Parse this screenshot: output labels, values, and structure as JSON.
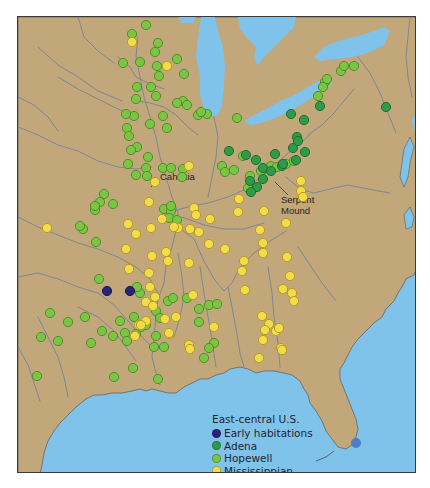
{
  "map": {
    "region": "East-central U.S.",
    "colors": {
      "land": "#c2a77b",
      "water": "#7fc3ea",
      "river": "#7c8894",
      "frame": "#3a3a3a",
      "early": "#2a2478",
      "adena": "#2f9a47",
      "hopewell": "#7cc443",
      "mississippian": "#f2dc4a"
    },
    "labels": {
      "cahokia": "Cahokia",
      "serpent_mound_line1": "Serpent",
      "serpent_mound_line2": "Mound"
    },
    "legend": {
      "title": "East-central U.S.",
      "items": [
        {
          "key": "early",
          "label": "Early habitations"
        },
        {
          "key": "adena",
          "label": "Adena"
        },
        {
          "key": "hopewell",
          "label": "Hopewell"
        },
        {
          "key": "mississippian",
          "label": "Mississippian"
        }
      ]
    },
    "sites": {
      "early": [
        [
          106,
          290
        ],
        [
          129,
          290
        ]
      ],
      "adena": [
        [
          385,
          106
        ],
        [
          290,
          113
        ],
        [
          303,
          119
        ],
        [
          245,
          154
        ],
        [
          255,
          159
        ],
        [
          262,
          167
        ],
        [
          228,
          150
        ],
        [
          249,
          180
        ],
        [
          270,
          170
        ],
        [
          274,
          153
        ],
        [
          292,
          147
        ],
        [
          296,
          136
        ],
        [
          297,
          140
        ],
        [
          256,
          186
        ],
        [
          262,
          178
        ],
        [
          281,
          165
        ],
        [
          250,
          191
        ],
        [
          282,
          163
        ],
        [
          319,
          105
        ],
        [
          304,
          151
        ],
        [
          295,
          159
        ]
      ],
      "hopewell": [
        [
          145,
          24
        ],
        [
          131,
          33
        ],
        [
          157,
          42
        ],
        [
          139,
          61
        ],
        [
          122,
          62
        ],
        [
          154,
          51
        ],
        [
          176,
          58
        ],
        [
          156,
          65
        ],
        [
          158,
          75
        ],
        [
          150,
          86
        ],
        [
          136,
          86
        ],
        [
          155,
          95
        ],
        [
          133,
          115
        ],
        [
          125,
          113
        ],
        [
          162,
          115
        ],
        [
          135,
          98
        ],
        [
          149,
          123
        ],
        [
          126,
          127
        ],
        [
          128,
          135
        ],
        [
          166,
          127
        ],
        [
          182,
          100
        ],
        [
          136,
          146
        ],
        [
          130,
          149
        ],
        [
          147,
          156
        ],
        [
          145,
          167
        ],
        [
          127,
          163
        ],
        [
          146,
          175
        ],
        [
          135,
          174
        ],
        [
          176,
          102
        ],
        [
          183,
          73
        ],
        [
          197,
          114
        ],
        [
          206,
          113
        ],
        [
          186,
          104
        ],
        [
          200,
          111
        ],
        [
          221,
          165
        ],
        [
          242,
          155
        ],
        [
          236,
          117
        ],
        [
          317,
          95
        ],
        [
          324,
          81
        ],
        [
          322,
          86
        ],
        [
          326,
          78
        ],
        [
          340,
          70
        ],
        [
          343,
          65
        ],
        [
          353,
          65
        ],
        [
          247,
          187
        ],
        [
          249,
          175
        ],
        [
          263,
          168
        ],
        [
          260,
          170
        ],
        [
          270,
          165
        ],
        [
          276,
          166
        ],
        [
          285,
          163
        ],
        [
          293,
          160
        ],
        [
          233,
          169
        ],
        [
          224,
          171
        ],
        [
          162,
          167
        ],
        [
          170,
          167
        ],
        [
          182,
          168
        ],
        [
          181,
          176
        ],
        [
          163,
          208
        ],
        [
          170,
          210
        ],
        [
          170,
          205
        ],
        [
          168,
          217
        ],
        [
          176,
          219
        ],
        [
          103,
          193
        ],
        [
          99,
          201
        ],
        [
          94,
          209
        ],
        [
          82,
          228
        ],
        [
          112,
          203
        ],
        [
          79,
          225
        ],
        [
          95,
          241
        ],
        [
          94,
          205
        ],
        [
          167,
          300
        ],
        [
          172,
          297
        ],
        [
          155,
          310
        ],
        [
          139,
          292
        ],
        [
          133,
          316
        ],
        [
          159,
          317
        ],
        [
          119,
          320
        ],
        [
          124,
          332
        ],
        [
          135,
          333
        ],
        [
          140,
          326
        ],
        [
          145,
          324
        ],
        [
          126,
          340
        ],
        [
          155,
          335
        ],
        [
          163,
          346
        ],
        [
          198,
          308
        ],
        [
          208,
          304
        ],
        [
          216,
          303
        ],
        [
          198,
          321
        ],
        [
          213,
          342
        ],
        [
          208,
          347
        ],
        [
          153,
          346
        ],
        [
          113,
          376
        ],
        [
          157,
          378
        ],
        [
          203,
          357
        ],
        [
          136,
          286
        ],
        [
          186,
          297
        ],
        [
          98,
          278
        ],
        [
          90,
          342
        ],
        [
          40,
          336
        ],
        [
          57,
          340
        ],
        [
          67,
          321
        ],
        [
          84,
          316
        ],
        [
          101,
          330
        ],
        [
          49,
          312
        ],
        [
          36,
          375
        ],
        [
          112,
          335
        ],
        [
          132,
          367
        ]
      ],
      "mississippian": [
        [
          131,
          41
        ],
        [
          166,
          65
        ],
        [
          154,
          181
        ],
        [
          188,
          165
        ],
        [
          193,
          207
        ],
        [
          195,
          214
        ],
        [
          148,
          201
        ],
        [
          161,
          218
        ],
        [
          177,
          227
        ],
        [
          165,
          251
        ],
        [
          151,
          255
        ],
        [
          167,
          260
        ],
        [
          148,
          272
        ],
        [
          149,
          286
        ],
        [
          154,
          296
        ],
        [
          145,
          301
        ],
        [
          152,
          305
        ],
        [
          145,
          320
        ],
        [
          168,
          333
        ],
        [
          168,
          332
        ],
        [
          175,
          316
        ],
        [
          164,
          318
        ],
        [
          188,
          344
        ],
        [
          189,
          348
        ],
        [
          138,
          324
        ],
        [
          134,
          335
        ],
        [
          140,
          324
        ],
        [
          127,
          223
        ],
        [
          135,
          233
        ],
        [
          150,
          227
        ],
        [
          189,
          228
        ],
        [
          238,
          198
        ],
        [
          285,
          222
        ],
        [
          259,
          229
        ],
        [
          262,
          242
        ],
        [
          286,
          256
        ],
        [
          241,
          270
        ],
        [
          289,
          275
        ],
        [
          282,
          288
        ],
        [
          291,
          292
        ],
        [
          293,
          300
        ],
        [
          280,
          347
        ],
        [
          261,
          315
        ],
        [
          268,
          323
        ],
        [
          264,
          329
        ],
        [
          275,
          330
        ],
        [
          262,
          339
        ],
        [
          281,
          349
        ],
        [
          258,
          357
        ],
        [
          278,
          327
        ],
        [
          237,
          211
        ],
        [
          263,
          210
        ],
        [
          208,
          243
        ],
        [
          224,
          248
        ],
        [
          243,
          260
        ],
        [
          262,
          252
        ],
        [
          46,
          227
        ],
        [
          125,
          248
        ],
        [
          128,
          268
        ],
        [
          198,
          231
        ],
        [
          173,
          226
        ],
        [
          209,
          218
        ],
        [
          188,
          262
        ],
        [
          192,
          294
        ],
        [
          213,
          326
        ],
        [
          244,
          289
        ],
        [
          300,
          180
        ],
        [
          300,
          190
        ],
        [
          302,
          196
        ]
      ]
    }
  }
}
